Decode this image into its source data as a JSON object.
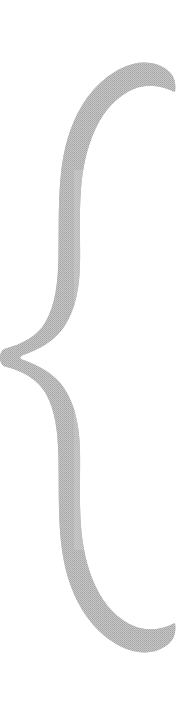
{
  "canvas": {
    "width": 180,
    "height": 705,
    "background_color": "#ffffff",
    "alt_text": "Large hand-drawn curly brace"
  },
  "glyph": {
    "name": "curly-brace",
    "character": "{",
    "description": "Tall hand-drawn left curly brace with cusp pointing left",
    "fill_color": "#b7b7b7",
    "texture": "dithered-halftone",
    "orientation": "vertical",
    "cusp_side": "left",
    "geometry": {
      "top_tip": [
        175,
        92
      ],
      "bottom_tip": [
        174,
        637
      ],
      "cusp_point": [
        21,
        357
      ],
      "upper_arm_center_x": 93,
      "lower_arm_center_x": 93,
      "stroke_width_nominal": 48,
      "bounds": {
        "x": 20,
        "y": 80,
        "width": 156,
        "height": 576
      }
    }
  }
}
